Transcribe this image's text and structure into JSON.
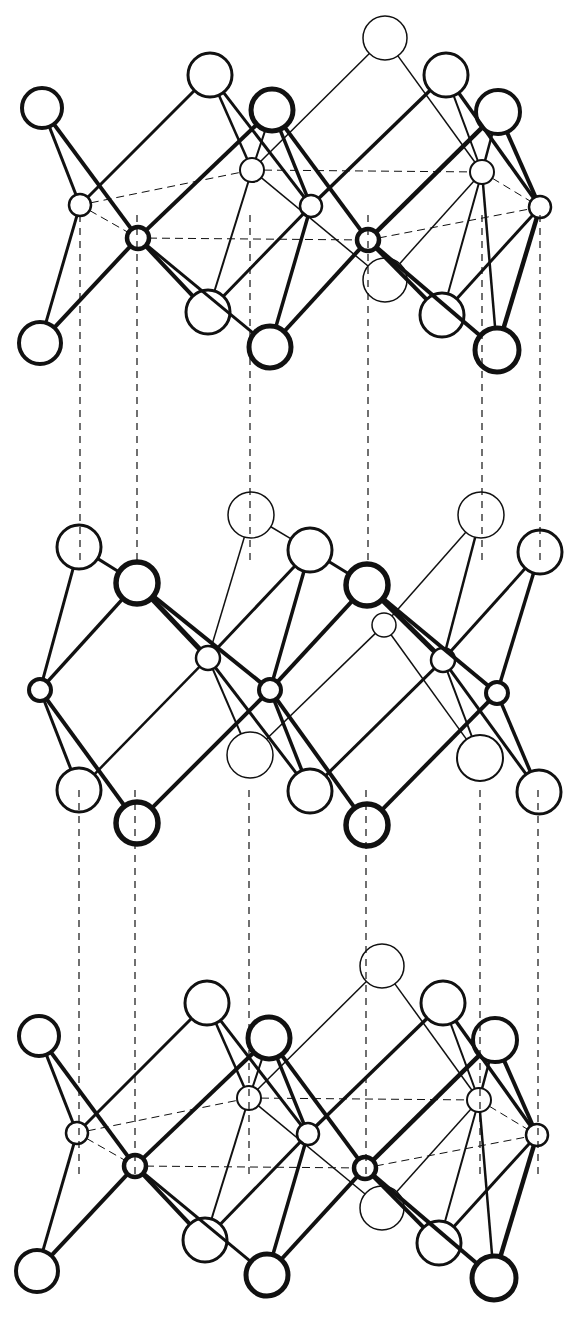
{
  "figure": {
    "title": "",
    "width": 583,
    "height": 1318,
    "colors": {
      "ink": "#111111",
      "paper": "#ffffff"
    }
  },
  "vertical_guides": {
    "upper_gap": {
      "x": [
        80,
        137,
        250,
        368,
        482,
        540
      ],
      "y1": 215,
      "y2": 560
    },
    "lower_gap": {
      "x": [
        79,
        135,
        249,
        366,
        480,
        538
      ],
      "y1": 790,
      "y2": 1180
    },
    "dash": "7,6"
  },
  "layers": [
    {
      "name": "top-layer",
      "dy": 0,
      "dx": 0,
      "atoms": [
        {
          "id": "A1",
          "x": 42,
          "y": 108,
          "r": 20,
          "w": 4
        },
        {
          "id": "A2",
          "x": 210,
          "y": 75,
          "r": 22,
          "w": 3
        },
        {
          "id": "A3",
          "x": 272,
          "y": 110,
          "r": 21,
          "w": 5
        },
        {
          "id": "A4",
          "x": 385,
          "y": 38,
          "r": 22,
          "w": 1.5
        },
        {
          "id": "A5",
          "x": 446,
          "y": 75,
          "r": 22,
          "w": 3
        },
        {
          "id": "A6",
          "x": 498,
          "y": 112,
          "r": 22,
          "w": 4
        },
        {
          "id": "c1",
          "x": 80,
          "y": 205,
          "r": 11,
          "w": 2.5
        },
        {
          "id": "c2",
          "x": 138,
          "y": 238,
          "r": 11,
          "w": 4.5
        },
        {
          "id": "c3",
          "x": 252,
          "y": 170,
          "r": 12,
          "w": 2
        },
        {
          "id": "c4",
          "x": 311,
          "y": 206,
          "r": 11,
          "w": 2.5
        },
        {
          "id": "c5",
          "x": 368,
          "y": 240,
          "r": 11,
          "w": 4.5
        },
        {
          "id": "c6",
          "x": 482,
          "y": 172,
          "r": 12,
          "w": 2
        },
        {
          "id": "c7",
          "x": 540,
          "y": 207,
          "r": 11,
          "w": 2.5
        },
        {
          "id": "B1",
          "x": 40,
          "y": 343,
          "r": 21,
          "w": 4
        },
        {
          "id": "B2",
          "x": 208,
          "y": 312,
          "r": 22,
          "w": 3
        },
        {
          "id": "B3",
          "x": 270,
          "y": 347,
          "r": 21,
          "w": 5
        },
        {
          "id": "B4",
          "x": 385,
          "y": 280,
          "r": 22,
          "w": 1.5
        },
        {
          "id": "B5",
          "x": 442,
          "y": 315,
          "r": 22,
          "w": 3
        },
        {
          "id": "B6",
          "x": 497,
          "y": 350,
          "r": 22,
          "w": 5
        }
      ],
      "bonds": [
        [
          "A1",
          "c1",
          3
        ],
        [
          "A1",
          "c2",
          4
        ],
        [
          "B1",
          "c1",
          3
        ],
        [
          "B1",
          "c2",
          4
        ],
        [
          "A2",
          "c1",
          3
        ],
        [
          "A2",
          "c3",
          2.5
        ],
        [
          "A2",
          "c4",
          3
        ],
        [
          "A3",
          "c2",
          4
        ],
        [
          "A3",
          "c3",
          2
        ],
        [
          "A3",
          "c4",
          3.5
        ],
        [
          "A3",
          "c5",
          4
        ],
        [
          "B2",
          "c2",
          4
        ],
        [
          "B2",
          "c3",
          2
        ],
        [
          "B2",
          "c4",
          3
        ],
        [
          "B3",
          "c4",
          3.5
        ],
        [
          "B3",
          "c5",
          4
        ],
        [
          "B3",
          "c2",
          3
        ],
        [
          "A4",
          "c3",
          1.5
        ],
        [
          "A4",
          "c6",
          1.5
        ],
        [
          "A5",
          "c4",
          3.5
        ],
        [
          "A5",
          "c6",
          2
        ],
        [
          "A5",
          "c7",
          3.5
        ],
        [
          "A6",
          "c5",
          4.5
        ],
        [
          "A6",
          "c7",
          4
        ],
        [
          "A6",
          "c6",
          2.5
        ],
        [
          "B4",
          "c3",
          1.5
        ],
        [
          "B4",
          "c6",
          1.5
        ],
        [
          "B5",
          "c5",
          4
        ],
        [
          "B5",
          "c6",
          2
        ],
        [
          "B5",
          "c7",
          3
        ],
        [
          "B6",
          "c5",
          4
        ],
        [
          "B6",
          "c7",
          4.5
        ],
        [
          "B6",
          "c6",
          2.5
        ]
      ],
      "dashed_bonds": [
        [
          "c1",
          "c3"
        ],
        [
          "c1",
          "c2"
        ],
        [
          "c2",
          "c5"
        ],
        [
          "c3",
          "c6"
        ],
        [
          "c5",
          "c7"
        ],
        [
          "c6",
          "c7"
        ]
      ]
    },
    {
      "name": "middle-layer",
      "dy": 0,
      "dx": 0,
      "atoms": [
        {
          "id": "A1",
          "x": 79,
          "y": 547,
          "r": 22,
          "w": 3
        },
        {
          "id": "A2",
          "x": 137,
          "y": 583,
          "r": 21,
          "w": 5.5
        },
        {
          "id": "A3",
          "x": 251,
          "y": 515,
          "r": 23,
          "w": 1.5
        },
        {
          "id": "A4",
          "x": 310,
          "y": 550,
          "r": 22,
          "w": 3
        },
        {
          "id": "A5",
          "x": 367,
          "y": 585,
          "r": 21,
          "w": 5.5
        },
        {
          "id": "A6",
          "x": 481,
          "y": 515,
          "r": 23,
          "w": 1.5
        },
        {
          "id": "A7",
          "x": 540,
          "y": 552,
          "r": 22,
          "w": 3
        },
        {
          "id": "c1",
          "x": 40,
          "y": 690,
          "r": 11,
          "w": 4
        },
        {
          "id": "c2",
          "x": 208,
          "y": 658,
          "r": 12,
          "w": 2.5
        },
        {
          "id": "c3",
          "x": 270,
          "y": 690,
          "r": 11,
          "w": 4
        },
        {
          "id": "c4",
          "x": 384,
          "y": 625,
          "r": 12,
          "w": 1.5
        },
        {
          "id": "c5",
          "x": 443,
          "y": 660,
          "r": 12,
          "w": 2.5
        },
        {
          "id": "c6",
          "x": 497,
          "y": 693,
          "r": 11,
          "w": 4
        },
        {
          "id": "B1",
          "x": 79,
          "y": 790,
          "r": 22,
          "w": 3
        },
        {
          "id": "B2",
          "x": 137,
          "y": 823,
          "r": 21,
          "w": 5.5
        },
        {
          "id": "B3",
          "x": 250,
          "y": 755,
          "r": 23,
          "w": 1.5
        },
        {
          "id": "B4",
          "x": 310,
          "y": 791,
          "r": 22,
          "w": 3
        },
        {
          "id": "B5",
          "x": 367,
          "y": 825,
          "r": 21,
          "w": 5.5
        },
        {
          "id": "B6",
          "x": 480,
          "y": 758,
          "r": 23,
          "w": 2
        },
        {
          "id": "B7",
          "x": 539,
          "y": 792,
          "r": 22,
          "w": 3
        }
      ],
      "bonds": [
        [
          "A1",
          "c1",
          3
        ],
        [
          "A2",
          "c1",
          3.5
        ],
        [
          "A1",
          "A2",
          3
        ],
        [
          "A2",
          "c2",
          5
        ],
        [
          "A2",
          "c3",
          4
        ],
        [
          "A3",
          "c2",
          1.5
        ],
        [
          "A3",
          "A4",
          1.5
        ],
        [
          "A4",
          "c2",
          3
        ],
        [
          "A4",
          "c3",
          3.5
        ],
        [
          "A4",
          "A5",
          3
        ],
        [
          "A5",
          "c3",
          4
        ],
        [
          "A5",
          "c5",
          5
        ],
        [
          "A5",
          "c6",
          4
        ],
        [
          "A6",
          "c4",
          1.5
        ],
        [
          "A6",
          "c5",
          2.5
        ],
        [
          "A7",
          "c5",
          3
        ],
        [
          "A7",
          "c6",
          3.5
        ],
        [
          "c1",
          "B1",
          3
        ],
        [
          "c1",
          "B2",
          4
        ],
        [
          "c2",
          "B1",
          2.5
        ],
        [
          "c2",
          "B3",
          2
        ],
        [
          "c2",
          "B4",
          3
        ],
        [
          "c3",
          "B2",
          4
        ],
        [
          "c3",
          "B4",
          3.5
        ],
        [
          "c3",
          "B5",
          4
        ],
        [
          "c4",
          "B3",
          1.5
        ],
        [
          "c4",
          "B6",
          1.5
        ],
        [
          "c5",
          "B4",
          3
        ],
        [
          "c5",
          "B6",
          2
        ],
        [
          "c5",
          "B7",
          3
        ],
        [
          "c6",
          "B5",
          4
        ],
        [
          "c6",
          "B7",
          3.5
        ]
      ],
      "dashed_bonds": []
    },
    {
      "name": "bottom-layer",
      "copy_of": "top-layer",
      "dy": 928,
      "dx": -3
    }
  ]
}
